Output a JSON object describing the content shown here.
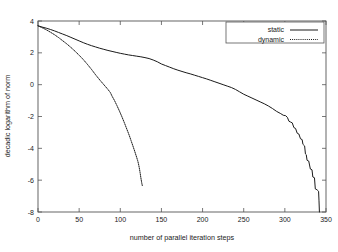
{
  "chart_data": {
    "type": "line",
    "title": "",
    "xlabel": "number of parallel iteration steps",
    "ylabel": "decadic logarithm of norm",
    "xlim": [
      0,
      350
    ],
    "ylim": [
      -8,
      4
    ],
    "xticks": [
      0,
      50,
      100,
      150,
      200,
      250,
      300,
      350
    ],
    "yticks": [
      4,
      2,
      0,
      -2,
      -4,
      -6,
      -8
    ],
    "xtick_labels": [
      "0",
      "50",
      "100",
      "150",
      "200",
      "250",
      "300",
      "350"
    ],
    "ytick_labels": [
      "4",
      "2",
      "0",
      "-2",
      "-4",
      "-6",
      "-8"
    ],
    "grid": false,
    "legend_position": "top-right",
    "legend_boxed": true,
    "line_color": "#1a1a1a",
    "background_color": "#ffffff",
    "frame_color": "#555555",
    "series": [
      {
        "name": "static",
        "style": "solid",
        "color": "#1a1a1a",
        "points": [
          [
            0,
            3.7
          ],
          [
            5,
            3.62
          ],
          [
            10,
            3.55
          ],
          [
            15,
            3.47
          ],
          [
            20,
            3.38
          ],
          [
            25,
            3.28
          ],
          [
            30,
            3.18
          ],
          [
            35,
            3.08
          ],
          [
            40,
            2.97
          ],
          [
            45,
            2.86
          ],
          [
            50,
            2.75
          ],
          [
            55,
            2.64
          ],
          [
            60,
            2.54
          ],
          [
            65,
            2.45
          ],
          [
            70,
            2.37
          ],
          [
            75,
            2.29
          ],
          [
            80,
            2.22
          ],
          [
            85,
            2.15
          ],
          [
            90,
            2.09
          ],
          [
            95,
            2.03
          ],
          [
            100,
            1.97
          ],
          [
            105,
            1.92
          ],
          [
            110,
            1.87
          ],
          [
            115,
            1.83
          ],
          [
            120,
            1.79
          ],
          [
            125,
            1.75
          ],
          [
            130,
            1.7
          ],
          [
            135,
            1.64
          ],
          [
            140,
            1.55
          ],
          [
            145,
            1.44
          ],
          [
            150,
            1.3
          ],
          [
            155,
            1.2
          ],
          [
            160,
            1.1
          ],
          [
            165,
            1.0
          ],
          [
            170,
            0.91
          ],
          [
            175,
            0.83
          ],
          [
            180,
            0.75
          ],
          [
            185,
            0.68
          ],
          [
            190,
            0.6
          ],
          [
            195,
            0.52
          ],
          [
            200,
            0.44
          ],
          [
            205,
            0.36
          ],
          [
            210,
            0.27
          ],
          [
            215,
            0.18
          ],
          [
            220,
            0.09
          ],
          [
            225,
            0.0
          ],
          [
            230,
            -0.09
          ],
          [
            235,
            -0.18
          ],
          [
            240,
            -0.3
          ],
          [
            245,
            -0.45
          ],
          [
            250,
            -0.6
          ],
          [
            255,
            -0.72
          ],
          [
            260,
            -0.84
          ],
          [
            265,
            -0.96
          ],
          [
            270,
            -1.08
          ],
          [
            275,
            -1.2
          ],
          [
            280,
            -1.34
          ],
          [
            285,
            -1.5
          ],
          [
            290,
            -1.68
          ],
          [
            295,
            -1.82
          ],
          [
            298,
            -1.92
          ],
          [
            301,
            -1.95
          ],
          [
            303,
            -2.05
          ],
          [
            305,
            -2.3
          ],
          [
            307,
            -2.35
          ],
          [
            309,
            -2.4
          ],
          [
            311,
            -2.7
          ],
          [
            313,
            -2.75
          ],
          [
            315,
            -3.05
          ],
          [
            317,
            -3.1
          ],
          [
            319,
            -3.4
          ],
          [
            321,
            -3.45
          ],
          [
            322,
            -3.75
          ],
          [
            323,
            -3.8
          ],
          [
            324,
            -3.85
          ],
          [
            325,
            -4.35
          ],
          [
            326,
            -4.4
          ],
          [
            327,
            -4.75
          ],
          [
            329,
            -4.8
          ],
          [
            331,
            -5.3
          ],
          [
            333,
            -5.35
          ],
          [
            334,
            -5.8
          ],
          [
            336,
            -5.85
          ],
          [
            337,
            -6.55
          ],
          [
            339,
            -6.6
          ],
          [
            340,
            -6.65
          ],
          [
            341,
            -6.7
          ],
          [
            341.5,
            -7.3
          ],
          [
            342,
            -8.0
          ]
        ]
      },
      {
        "name": "dynamic",
        "style": "dotted",
        "color": "#1a1a1a",
        "points": [
          [
            0,
            3.7
          ],
          [
            5,
            3.58
          ],
          [
            10,
            3.45
          ],
          [
            15,
            3.3
          ],
          [
            20,
            3.14
          ],
          [
            25,
            2.96
          ],
          [
            30,
            2.76
          ],
          [
            35,
            2.56
          ],
          [
            40,
            2.34
          ],
          [
            45,
            2.1
          ],
          [
            50,
            1.85
          ],
          [
            55,
            1.58
          ],
          [
            60,
            1.28
          ],
          [
            65,
            0.96
          ],
          [
            70,
            0.62
          ],
          [
            75,
            0.3
          ],
          [
            80,
            0.0
          ],
          [
            85,
            -0.3
          ],
          [
            88,
            -0.5
          ],
          [
            90,
            -0.72
          ],
          [
            93,
            -1.0
          ],
          [
            96,
            -1.32
          ],
          [
            99,
            -1.66
          ],
          [
            102,
            -2.02
          ],
          [
            105,
            -2.4
          ],
          [
            108,
            -2.8
          ],
          [
            111,
            -3.2
          ],
          [
            113,
            -3.5
          ],
          [
            115,
            -3.8
          ],
          [
            117,
            -4.1
          ],
          [
            119,
            -4.42
          ],
          [
            121,
            -4.75
          ],
          [
            122,
            -4.95
          ],
          [
            123,
            -5.2
          ],
          [
            124,
            -5.5
          ],
          [
            125,
            -5.85
          ],
          [
            126,
            -6.15
          ],
          [
            127,
            -6.4
          ]
        ]
      }
    ]
  },
  "legend": {
    "entries": [
      {
        "label": "static"
      },
      {
        "label": "dynamic"
      }
    ]
  }
}
